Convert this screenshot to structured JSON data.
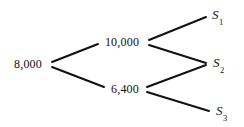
{
  "figure": {
    "background_color": "#ffffff",
    "line_color": "#111111",
    "text_color": "#111111",
    "line_width": 2
  },
  "chart_data": {
    "type": "diagram",
    "subtype": "binomial-tree",
    "title": "",
    "nodes": [
      {
        "id": "root",
        "label": "8,000",
        "x": 47,
        "y": 64,
        "level": 0
      },
      {
        "id": "up",
        "label": "10,000",
        "x": 145,
        "y": 42,
        "level": 1
      },
      {
        "id": "down",
        "label": "6,400",
        "x": 145,
        "y": 89,
        "level": 1
      },
      {
        "id": "s1",
        "label": "S1",
        "x": 207,
        "y": 16,
        "level": 2
      },
      {
        "id": "s2",
        "label": "S2",
        "x": 207,
        "y": 64,
        "level": 2
      },
      {
        "id": "s3",
        "label": "S3",
        "x": 210,
        "y": 112,
        "level": 2
      }
    ],
    "edges": [
      {
        "from": "root",
        "to": "up",
        "x1": 52,
        "y1": 62,
        "x2": 98,
        "y2": 44
      },
      {
        "from": "root",
        "to": "down",
        "x1": 52,
        "y1": 67,
        "x2": 104,
        "y2": 87
      },
      {
        "from": "up",
        "to": "s1",
        "x1": 149,
        "y1": 40,
        "x2": 206,
        "y2": 17
      },
      {
        "from": "up",
        "to": "s2",
        "x1": 149,
        "y1": 45,
        "x2": 206,
        "y2": 63
      },
      {
        "from": "down",
        "to": "s2",
        "x1": 147,
        "y1": 87,
        "x2": 206,
        "y2": 65
      },
      {
        "from": "down",
        "to": "s3",
        "x1": 147,
        "y1": 92,
        "x2": 209,
        "y2": 111
      }
    ],
    "values": [
      8000,
      10000,
      6400
    ],
    "leaf_labels": [
      "S1",
      "S2",
      "S3"
    ]
  },
  "labels": {
    "root_value": "8,000",
    "up_value": "10,000",
    "down_value": "6,400",
    "leaf_1_base": "S",
    "leaf_1_sub": "1",
    "leaf_2_base": "S",
    "leaf_2_sub": "2",
    "leaf_3_base": "S",
    "leaf_3_sub": "3"
  }
}
